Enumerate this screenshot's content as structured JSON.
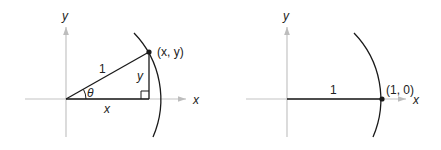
{
  "left_figure": {
    "axis_x_label": "x",
    "axis_y_label": "y",
    "hypotenuse_label": "1",
    "opposite_label": "y",
    "adjacent_label": "x",
    "angle_label": "θ",
    "point_label": "(x, y)"
  },
  "right_figure": {
    "axis_x_label": "x",
    "axis_y_label": "y",
    "radius_label": "1",
    "point_label": "(1, 0)"
  },
  "colors": {
    "axis": "#bdbdbd",
    "line": "#1a1a1a",
    "text": "#222222"
  }
}
